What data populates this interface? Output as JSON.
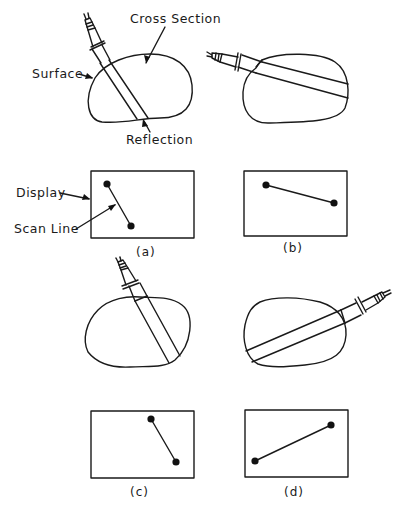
{
  "diagram": {
    "labels": {
      "cross_section": "Cross Section",
      "surface": "Surface",
      "reflection": "Reflection",
      "display": "Display",
      "scan_line": "Scan Line"
    },
    "panels": [
      {
        "id": "a",
        "caption": "(a)",
        "probe_angle": "steep, entering from upper left",
        "scan_line": {
          "from": [
            107,
            184
          ],
          "to": [
            131,
            226
          ]
        }
      },
      {
        "id": "b",
        "caption": "(b)",
        "probe_angle": "shallow, entering from left",
        "scan_line": {
          "from": [
            266,
            185
          ],
          "to": [
            334,
            203
          ]
        }
      },
      {
        "id": "c",
        "caption": "(c)",
        "probe_angle": "steep, entering from top right of center",
        "scan_line": {
          "from": [
            151,
            419
          ],
          "to": [
            176,
            462
          ]
        }
      },
      {
        "id": "d",
        "caption": "(d)",
        "probe_angle": "shallow, entering from right",
        "scan_line": {
          "from": [
            255,
            461
          ],
          "to": [
            331,
            425
          ]
        }
      }
    ],
    "colors": {
      "ink": "#1a1a1a",
      "background": "#ffffff"
    }
  }
}
